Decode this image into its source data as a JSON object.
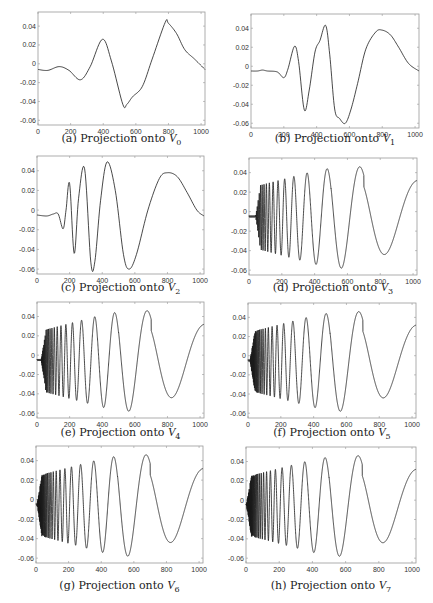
{
  "figure": {
    "width": 433,
    "height": 603,
    "line_color": "#1a1a1a",
    "frame_color": "#999999"
  },
  "chart_data": [
    {
      "id": "a",
      "type": "line",
      "caption_prefix": "(a) Projection onto ",
      "caption_symbol": "V",
      "caption_sub": "0",
      "xlim": [
        0,
        1024
      ],
      "ylim": [
        -0.065,
        0.055
      ],
      "xticks": [
        0,
        200,
        400,
        600,
        800,
        1000
      ],
      "yticks": [
        0.04,
        0.02,
        0,
        -0.02,
        -0.04,
        -0.06
      ],
      "ytick_labels": [
        "0.04",
        "0.02",
        "0",
        "-0.02",
        "-0.04",
        "-0.06"
      ],
      "xtick_labels": [
        "0",
        "200",
        "400",
        "600",
        "800",
        "1000"
      ],
      "x": [
        0,
        60,
        130,
        190,
        260,
        320,
        395,
        450,
        520,
        545,
        580,
        640,
        700,
        780,
        800,
        850,
        900,
        960,
        1024
      ],
      "y": [
        -0.006,
        -0.007,
        -0.003,
        -0.007,
        -0.017,
        -0.003,
        0.026,
        0.003,
        -0.043,
        -0.043,
        -0.035,
        -0.024,
        0.005,
        0.044,
        0.043,
        0.032,
        0.015,
        0.005,
        -0.006
      ]
    },
    {
      "id": "b",
      "type": "line",
      "caption_prefix": "(b) Projection onto ",
      "caption_symbol": "V",
      "caption_sub": "1",
      "xlim": [
        0,
        1024
      ],
      "ylim": [
        -0.065,
        0.055
      ],
      "xticks": [
        0,
        200,
        400,
        600,
        800,
        1000
      ],
      "yticks": [
        0.04,
        0.02,
        0,
        -0.02,
        -0.04,
        -0.06
      ],
      "ytick_labels": [
        "0.04",
        "0.02",
        "0",
        "-0.02",
        "-0.04",
        "-0.06"
      ],
      "xtick_labels": [
        "0",
        "200",
        "400",
        "600",
        "800",
        "1000"
      ],
      "x": [
        0,
        40,
        70,
        100,
        160,
        200,
        225,
        265,
        290,
        325,
        355,
        390,
        420,
        455,
        480,
        510,
        540,
        575,
        610,
        650,
        700,
        760,
        800,
        850,
        900,
        960,
        1024
      ],
      "y": [
        -0.005,
        -0.005,
        -0.004,
        -0.005,
        -0.006,
        -0.012,
        -0.003,
        0.021,
        0.005,
        -0.046,
        -0.025,
        0.015,
        0.027,
        0.043,
        0.012,
        -0.045,
        -0.055,
        -0.06,
        -0.045,
        -0.018,
        0.018,
        0.036,
        0.038,
        0.033,
        0.02,
        0.003,
        -0.005
      ]
    },
    {
      "id": "c",
      "type": "line",
      "caption_prefix": "(c) Projection onto ",
      "caption_symbol": "V",
      "caption_sub": "2",
      "xlim": [
        0,
        1024
      ],
      "ylim": [
        -0.065,
        0.055
      ],
      "xticks": [
        0,
        200,
        400,
        600,
        800,
        1000
      ],
      "yticks": [
        0.04,
        0.02,
        0,
        -0.02,
        -0.04,
        -0.06
      ],
      "ytick_labels": [
        "0.04",
        "0.02",
        "0",
        "-0.02",
        "-0.04",
        "-0.06"
      ],
      "xtick_labels": [
        "0",
        "200",
        "400",
        "600",
        "800",
        "1000"
      ],
      "x": [
        0,
        60,
        100,
        130,
        160,
        178,
        200,
        228,
        255,
        292,
        330,
        355,
        390,
        430,
        480,
        530,
        565,
        610,
        680,
        750,
        800,
        860,
        920,
        980,
        1024
      ],
      "y": [
        -0.005,
        -0.006,
        -0.004,
        -0.004,
        -0.019,
        0.0,
        0.027,
        -0.044,
        0.012,
        0.042,
        -0.053,
        -0.052,
        0.01,
        0.049,
        0.02,
        -0.045,
        -0.06,
        -0.045,
        0.0,
        0.032,
        0.038,
        0.034,
        0.018,
        0.0,
        -0.006
      ]
    },
    {
      "id": "d",
      "type": "line",
      "caption_prefix": "(d) Projection onto ",
      "caption_symbol": "V",
      "caption_sub": "3",
      "xlim": [
        0,
        1024
      ],
      "ylim": [
        -0.065,
        0.055
      ],
      "xticks": [
        0,
        200,
        400,
        600,
        800,
        1000
      ],
      "yticks": [
        0.04,
        0.02,
        0,
        -0.02,
        -0.04,
        -0.06
      ],
      "ytick_labels": [
        "0.04",
        "0.02",
        "0",
        "-0.02",
        "-0.04",
        "-0.06"
      ],
      "xtick_labels": [
        "0",
        "200",
        "400",
        "600",
        "800",
        "1000"
      ],
      "chirp": {
        "start": 40,
        "amp_env": "d"
      }
    },
    {
      "id": "e",
      "type": "line",
      "caption_prefix": "(e) Projection onto ",
      "caption_symbol": "V",
      "caption_sub": "4",
      "xlim": [
        0,
        1024
      ],
      "ylim": [
        -0.065,
        0.055
      ],
      "xticks": [
        0,
        200,
        400,
        600,
        800,
        1000
      ],
      "yticks": [
        0.04,
        0.02,
        0,
        -0.02,
        -0.04,
        -0.06
      ],
      "ytick_labels": [
        "0.04",
        "0.02",
        "0",
        "-0.02",
        "-0.04",
        "-0.06"
      ],
      "xtick_labels": [
        "0",
        "200",
        "400",
        "600",
        "800",
        "1000"
      ],
      "chirp": {
        "start": 25,
        "amp_env": "e"
      }
    },
    {
      "id": "f",
      "type": "line",
      "caption_prefix": "(f) Projection onto ",
      "caption_symbol": "V",
      "caption_sub": "5",
      "xlim": [
        0,
        1024
      ],
      "ylim": [
        -0.065,
        0.055
      ],
      "xticks": [
        0,
        200,
        400,
        600,
        800,
        1000
      ],
      "yticks": [
        0.04,
        0.02,
        0,
        -0.02,
        -0.04,
        -0.06
      ],
      "ytick_labels": [
        "0.04",
        "0.02",
        "0",
        "-0.02",
        "-0.04",
        "-0.06"
      ],
      "xtick_labels": [
        "0",
        "200",
        "400",
        "600",
        "800",
        "1000"
      ],
      "chirp": {
        "start": 12,
        "amp_env": "f"
      }
    },
    {
      "id": "g",
      "type": "line",
      "caption_prefix": "(g) Projection onto ",
      "caption_symbol": "V",
      "caption_sub": "6",
      "xlim": [
        0,
        1024
      ],
      "ylim": [
        -0.065,
        0.055
      ],
      "xticks": [
        0,
        200,
        400,
        600,
        800,
        1000
      ],
      "yticks": [
        0.04,
        0.02,
        0,
        -0.02,
        -0.04,
        -0.06
      ],
      "ytick_labels": [
        "0.04",
        "0.02",
        "0",
        "-0.02",
        "-0.04",
        "-0.06"
      ],
      "xtick_labels": [
        "0",
        "200",
        "400",
        "600",
        "800",
        "1000"
      ],
      "chirp": {
        "start": 6,
        "amp_env": "g"
      }
    },
    {
      "id": "h",
      "type": "line",
      "caption_prefix": "(h) Projection onto ",
      "caption_symbol": "V",
      "caption_sub": "7",
      "xlim": [
        0,
        1024
      ],
      "ylim": [
        -0.065,
        0.055
      ],
      "xticks": [
        0,
        200,
        400,
        600,
        800,
        1000
      ],
      "yticks": [
        0.04,
        0.02,
        0,
        -0.02,
        -0.04,
        -0.06
      ],
      "ytick_labels": [
        "0.04",
        "0.02",
        "0",
        "-0.02",
        "-0.04",
        "-0.06"
      ],
      "xtick_labels": [
        "0",
        "200",
        "400",
        "600",
        "800",
        "1000"
      ],
      "chirp": {
        "start": 2,
        "amp_env": "h"
      }
    }
  ],
  "layout": {
    "panels": [
      {
        "id": "a",
        "frame": [
          38,
          12,
          205,
          125
        ],
        "caption_y": 131
      },
      {
        "id": "b",
        "frame": [
          251,
          14,
          419,
          128
        ],
        "caption_y": 131
      },
      {
        "id": "c",
        "frame": [
          37,
          156,
          204,
          274
        ],
        "caption_y": 280
      },
      {
        "id": "d",
        "frame": [
          249,
          158,
          417,
          275
        ],
        "caption_y": 280
      },
      {
        "id": "e",
        "frame": [
          37,
          302,
          204,
          418
        ],
        "caption_y": 425
      },
      {
        "id": "f",
        "frame": [
          248,
          303,
          416,
          418
        ],
        "caption_y": 425
      },
      {
        "id": "g",
        "frame": [
          36,
          446,
          203,
          563
        ],
        "caption_y": 578
      },
      {
        "id": "h",
        "frame": [
          246,
          447,
          416,
          563
        ],
        "caption_y": 578
      }
    ]
  }
}
